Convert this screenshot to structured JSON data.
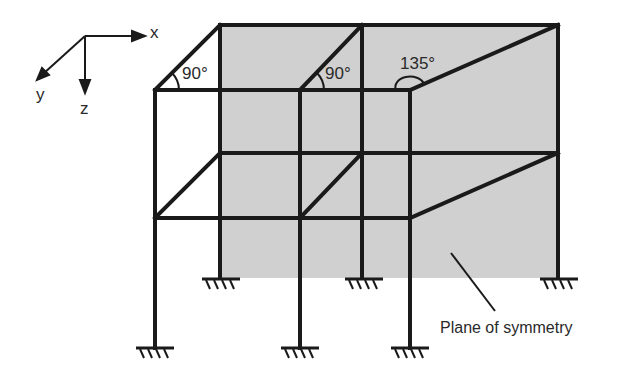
{
  "figure": {
    "colors": {
      "member": "#1a1a1a",
      "plane_fill": "#d0d0d0",
      "text": "#2a2a2a",
      "background": "#ffffff"
    }
  },
  "axes": {
    "x_label": "x",
    "y_label": "y",
    "z_label": "z"
  },
  "angles": [
    {
      "label": "90°",
      "location": "front-left top corner"
    },
    {
      "label": "90°",
      "location": "front-middle top corner"
    },
    {
      "label": "135°",
      "location": "front-right top corner"
    }
  ],
  "annotation": {
    "label": "Plane of symmetry"
  },
  "supports": {
    "type": "fixed",
    "count": 6
  }
}
